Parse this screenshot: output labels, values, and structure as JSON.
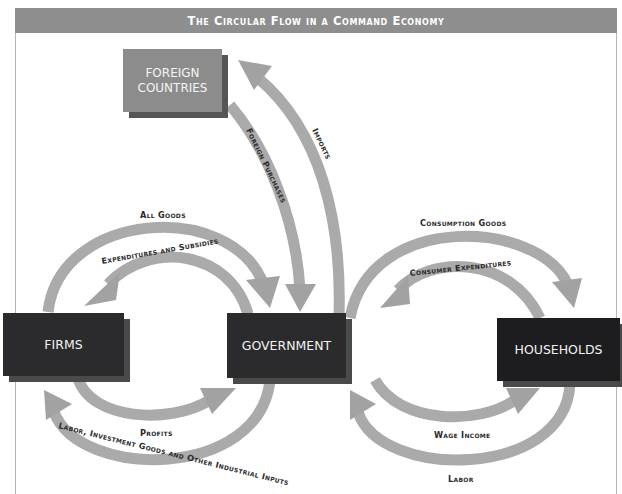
{
  "title": "The Circular Flow in a Command Economy",
  "nodes": {
    "foreign": {
      "label_line1": "FOREIGN",
      "label_line2": "COUNTRIES"
    },
    "firms": {
      "label": "FIRMS"
    },
    "government": {
      "label": "GOVERNMENT"
    },
    "households": {
      "label": "HOUSEHOLDS"
    }
  },
  "flows": {
    "imports": "Imports",
    "foreign_purchases": "Foreign Purchases",
    "all_goods": "All Goods",
    "expenditures_subsidies": "Expenditures and Subsidies",
    "profits": "Profits",
    "labor_investment": "Labor, Investment Goods and Other Industrial Inputs",
    "consumption_goods": "Consumption Goods",
    "consumer_expenditures": "Consumer Expenditures",
    "wage_income": "Wage Income",
    "labor": "Labor"
  },
  "colors": {
    "banner": "#8e8e8e",
    "arrow": "#a9a9a9",
    "box_dark": "#2b2b2d",
    "box_foreign": "#8c8c8c"
  }
}
